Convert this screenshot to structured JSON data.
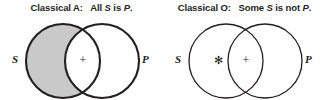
{
  "figure": {
    "background_color": "#ffffff",
    "ink_color": "#231f20",
    "shade_color": "#c9c9c9"
  },
  "panels": [
    {
      "id": "classical-a",
      "title_prefix": "Classical A:",
      "title_quantifier": "All",
      "title_subject": "S",
      "title_copula": "is",
      "title_predicate": "P",
      "title_period": ".",
      "title_full": "Classical A: All S is P.",
      "subject_label": "S",
      "predicate_label": "P",
      "shaded_region": "subject-only",
      "marks": [
        {
          "symbol": "+",
          "region": "intersection"
        }
      ]
    },
    {
      "id": "classical-o",
      "title_prefix": "Classical O:",
      "title_quantifier": "Some",
      "title_subject": "S",
      "title_copula": "is not",
      "title_predicate": "P",
      "title_period": ".",
      "title_full": "Classical O: Some S is not P.",
      "subject_label": "S",
      "predicate_label": "P",
      "shaded_region": "none",
      "marks": [
        {
          "symbol": "✻",
          "region": "subject-only"
        },
        {
          "symbol": "+",
          "region": "intersection"
        }
      ]
    }
  ]
}
